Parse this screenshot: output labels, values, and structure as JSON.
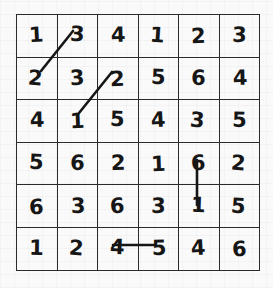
{
  "puzzle": {
    "title": "6x6 number grid puzzle",
    "rows": 6,
    "columns": 6,
    "grid": [
      [
        "1",
        "3",
        "4",
        "1",
        "2",
        "3"
      ],
      [
        "2",
        "3",
        "2",
        "5",
        "6",
        "4"
      ],
      [
        "4",
        "1",
        "5",
        "4",
        "3",
        "5"
      ],
      [
        "5",
        "6",
        "2",
        "1",
        "6",
        "2"
      ],
      [
        "6",
        "3",
        "6",
        "3",
        "1",
        "5"
      ],
      [
        "1",
        "2",
        "4",
        "5",
        "4",
        "6"
      ]
    ],
    "ink_color": "#161616",
    "grid_line_color": "#2b2b2b",
    "paper_color": "#fafafa"
  },
  "annotations": {
    "marks": [
      {
        "name": "diagonal-connector-3-to-2",
        "type": "line",
        "from_cell": "r1c2",
        "to_cell": "r2c1",
        "from_value": "3",
        "to_value": "2",
        "x1": 73,
        "y1": 31,
        "x2": 41,
        "y2": 71
      },
      {
        "name": "diagonal-connector-2-to-1",
        "type": "line",
        "from_cell": "r2c3",
        "to_cell": "r3c2",
        "from_value": "2",
        "to_value": "1",
        "x1": 112,
        "y1": 72,
        "x2": 79,
        "y2": 113
      },
      {
        "name": "vertical-connector-6-to-1",
        "type": "line",
        "from_cell": "r4c5",
        "to_cell": "r5c5",
        "from_value": "6",
        "to_value": "1",
        "x1": 197,
        "y1": 160,
        "x2": 197,
        "y2": 205
      },
      {
        "name": "horizontal-connector-4-to-5",
        "type": "line",
        "from_cell": "r6c3",
        "to_cell": "r6c4",
        "from_value": "4",
        "to_value": "5",
        "x1": 113,
        "y1": 245,
        "x2": 155,
        "y2": 245
      }
    ]
  }
}
